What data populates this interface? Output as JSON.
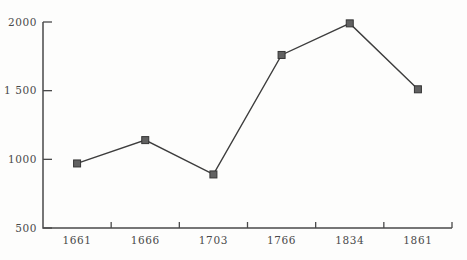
{
  "page": {
    "background": "#fdfdfc"
  },
  "chart_data": {
    "type": "line",
    "title": "",
    "xlabel": "",
    "ylabel": "",
    "categories": [
      "1661",
      "1666",
      "1703",
      "1766",
      "1834",
      "1861"
    ],
    "values": [
      970,
      1140,
      890,
      1760,
      1990,
      1510
    ],
    "ylim": [
      500,
      2000
    ],
    "yticks": [
      500,
      1000,
      1500,
      2000
    ],
    "ytick_labels": [
      "500",
      "1000",
      "1 500",
      "2000"
    ],
    "grid": false,
    "legend": false,
    "marker": "square",
    "marker_size": 7,
    "colors": {
      "line": "#3d3d3d",
      "marker_fill": "#616161",
      "marker_stroke": "#353535",
      "axis": "#4a4a4a",
      "text": "#4a4a4a",
      "background": "#fdfdfc"
    },
    "layout": {
      "width": 467,
      "height": 260,
      "plot_left": 43,
      "plot_right": 452,
      "plot_top": 22,
      "plot_bottom": 228,
      "ytick_length": 9,
      "xtick_length": 6,
      "x_label_offset": 16,
      "y_label_gap": 6
    }
  }
}
